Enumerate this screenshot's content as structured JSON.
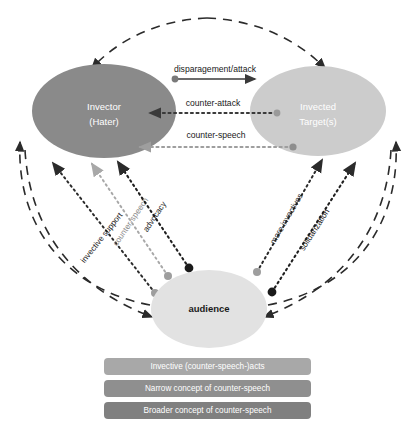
{
  "figure": {
    "type": "node-link-diagram",
    "background": "#ffffff"
  },
  "nodes": [
    {
      "id": "invector",
      "label_line1": "Invector",
      "label_line2": "(Hater)",
      "fill": "#8a8a8a",
      "text_color": "#ffffff"
    },
    {
      "id": "invected_target",
      "label_line1": "Invected",
      "label_line2": "Target(s)",
      "fill": "#cccccc",
      "text_color": "#ffffff"
    },
    {
      "id": "audience",
      "label_line1": "audience",
      "label_line2": "",
      "fill": "#e2e2e2",
      "text_color": "#1a1a1a"
    }
  ],
  "edges": {
    "disparagement": {
      "label": "disparagement/attack",
      "style": "solid",
      "color": "#3a3a3a",
      "from": "invector",
      "to": "invected_target"
    },
    "counter_attack": {
      "label": "counter-attack",
      "style": "dotted",
      "color": "#3a3a3a",
      "from": "invected_target",
      "to": "invector"
    },
    "counter_speech_h": {
      "label": "counter-speech",
      "style": "dotted",
      "color": "#9e9e9e",
      "from": "invected_target",
      "to": "invector"
    },
    "invective_support": {
      "label": "invective support",
      "style": "dotted",
      "color": "#2b2b2b",
      "from": "audience",
      "to": "invector"
    },
    "counter_speech_d": {
      "label": "counter-speech",
      "style": "dotted",
      "color": "#a8a8a8",
      "from": "audience",
      "to": "invector"
    },
    "advocacy": {
      "label": "advocacy",
      "style": "dotted",
      "color": "#1f1f1f",
      "from": "audience",
      "to": "invector"
    },
    "more_invectives": {
      "label": "more invectives",
      "style": "dotted",
      "color": "#2b2b2b",
      "from": "audience",
      "to": "invected_target"
    },
    "solidarization": {
      "label": "solidarization",
      "style": "dotted",
      "color": "#1f1f1f",
      "from": "audience",
      "to": "invected_target"
    },
    "top_arc": {
      "label": "",
      "style": "dashed",
      "color": "#2b2b2b",
      "from": "arc-apex",
      "to": "both-top-nodes"
    },
    "left_arc": {
      "label": "",
      "style": "dashed",
      "color": "#2b2b2b",
      "from": "audience",
      "to": "invector"
    },
    "right_arc": {
      "label": "",
      "style": "dashed",
      "color": "#2b2b2b",
      "from": "audience",
      "to": "invected_target"
    }
  },
  "legend": {
    "items": [
      {
        "label": "Invective (counter-speech-)acts",
        "fill": "#a8a8a8"
      },
      {
        "label": "Narrow concept of counter-speech",
        "fill": "#8f8f8f"
      },
      {
        "label": "Broader concept of counter-speech",
        "fill": "#808080"
      }
    ]
  }
}
